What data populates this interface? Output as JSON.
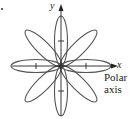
{
  "figure": {
    "type": "polar rose curve",
    "petals": 8,
    "labels": {
      "y_axis": "y",
      "x_axis": "x",
      "polar_axis_line1": "Polar",
      "polar_axis_line2": "axis"
    },
    "colors": {
      "curve": "#555555",
      "axes": "#222222"
    }
  }
}
